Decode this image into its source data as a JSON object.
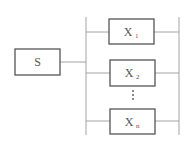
{
  "diagram": {
    "type": "parallel-system-block-diagram",
    "source_block": {
      "label": "S"
    },
    "parallel_blocks": [
      {
        "label": "X",
        "subscript": "1"
      },
      {
        "label": "X",
        "subscript": "2"
      },
      {
        "label": "X",
        "subscript": "n"
      }
    ],
    "ellipsis": "⋮",
    "colors": {
      "box_stroke": "#555555",
      "wire": "#9a9a9a",
      "text": "#555555"
    }
  }
}
